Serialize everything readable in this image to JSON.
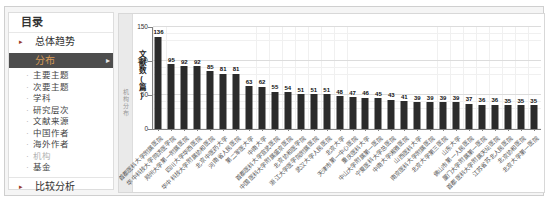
{
  "colors": {
    "active_bg": "#4d4d4d",
    "active_text": "#d69a57",
    "bar": "#2b2b2b",
    "bullet": "#99392c"
  },
  "sidebar": {
    "title": "目录",
    "section_top": "总体趋势",
    "active_item": "分布",
    "sub_items": [
      {
        "label": "主要主题",
        "current": false
      },
      {
        "label": "次要主题",
        "current": false
      },
      {
        "label": "学科",
        "current": false
      },
      {
        "label": "研究层次",
        "current": false
      },
      {
        "label": "文献来源",
        "current": false
      },
      {
        "label": "中国作者",
        "current": false
      },
      {
        "label": "海外作者",
        "current": false
      },
      {
        "label": "机构",
        "current": true
      },
      {
        "label": "基金",
        "current": false
      }
    ],
    "section_bottom": "比较分析"
  },
  "panel": {
    "side_label": "机构分布"
  },
  "chart_data": {
    "type": "bar",
    "title": "机构分布",
    "ylabel": "文献数(篇)",
    "xlabel": "",
    "ylim": [
      0,
      150
    ],
    "yticks": [
      0,
      50,
      100,
      150
    ],
    "grid": true,
    "legend": false,
    "categories": [
      "首都医科大学附属医院",
      "华中科技大学同济医学院",
      "郑州大学第一附属医院",
      "四川大学华西医院",
      "华中科技大学附属协和医院",
      "北京中医药大学",
      "河南省人民医院",
      "第二军医大学",
      "中南大学",
      "首都医科大学宣武医院",
      "中国医科大学附属盛京医院",
      "北京协和医学院",
      "浙江大学医学院附属医院",
      "武汉大学人民医院",
      "北京大学",
      "天津市第一中心医院",
      "重庆医科大学",
      "中山大学附属第一医院",
      "宁夏医科大学总医院",
      "中南大学湘雅医院",
      "山西医科大学",
      "南京医科大学附属医院",
      "北京大学第三医院",
      "山东大学",
      "佛山市第一人民医院",
      "厦门大学附属第一医院",
      "首都医科大学附属天坛医院",
      "江苏省苏北人民医院",
      "北京协和医院",
      "北京大学第一医院"
    ],
    "values": [
      136,
      95,
      92,
      92,
      85,
      81,
      81,
      63,
      62,
      55,
      54,
      51,
      51,
      51,
      48,
      47,
      46,
      45,
      43,
      41,
      39,
      39,
      39,
      39,
      37,
      36,
      36,
      35,
      35,
      35
    ]
  }
}
